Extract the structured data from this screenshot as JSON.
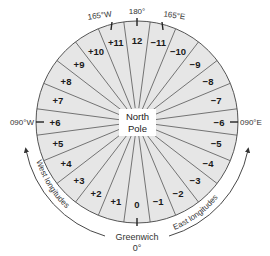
{
  "diagram": {
    "center_label_line1": "North",
    "center_label_line2": "Pole",
    "zones": [
      {
        "angle": 0,
        "label": "12"
      },
      {
        "angle": 15,
        "label": "−11"
      },
      {
        "angle": 30,
        "label": "−10"
      },
      {
        "angle": 45,
        "label": "−9"
      },
      {
        "angle": 60,
        "label": "−8"
      },
      {
        "angle": 75,
        "label": "−7"
      },
      {
        "angle": 90,
        "label": "−6"
      },
      {
        "angle": 105,
        "label": "−5"
      },
      {
        "angle": 120,
        "label": "−4"
      },
      {
        "angle": 135,
        "label": "−3"
      },
      {
        "angle": 150,
        "label": "−2"
      },
      {
        "angle": 165,
        "label": "−1"
      },
      {
        "angle": 180,
        "label": "0"
      },
      {
        "angle": 195,
        "label": "+1"
      },
      {
        "angle": 210,
        "label": "+2"
      },
      {
        "angle": 225,
        "label": "+3"
      },
      {
        "angle": 240,
        "label": "+4"
      },
      {
        "angle": 255,
        "label": "+5"
      },
      {
        "angle": 270,
        "label": "+6"
      },
      {
        "angle": 285,
        "label": "+7"
      },
      {
        "angle": 300,
        "label": "+8"
      },
      {
        "angle": 315,
        "label": "+9"
      },
      {
        "angle": 330,
        "label": "+10"
      },
      {
        "angle": 345,
        "label": "+11"
      }
    ],
    "meridian_labels": {
      "w165": "165°W",
      "top": "180°",
      "e165": "165°E",
      "west": "090°W",
      "east": "090°E",
      "greenwich": "Greenwich",
      "greenwich_deg": "0°"
    },
    "arc_labels": {
      "west": "West longitudes",
      "east": "East longitudes"
    },
    "colors": {
      "fill": "#e6e6e6",
      "line": "#555555",
      "text": "#1a1a1a"
    }
  }
}
